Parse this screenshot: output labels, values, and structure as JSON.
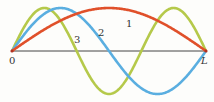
{
  "diagram": {
    "type": "standing-wave-modes",
    "axis": {
      "start_label": "0",
      "end_label": "L",
      "color": "#444444"
    },
    "modes": [
      {
        "label": "1",
        "harmonic": 1,
        "color": "#e0502a"
      },
      {
        "label": "2",
        "harmonic": 2,
        "color": "#5aaee0"
      },
      {
        "label": "3",
        "harmonic": 3,
        "color": "#b5c94a"
      }
    ]
  }
}
